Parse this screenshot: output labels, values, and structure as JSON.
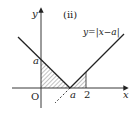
{
  "diagram": {
    "panel_label": "(ii)",
    "function_label": "y=|x−a|",
    "axes": {
      "x_label": "x",
      "y_label": "y",
      "origin_label": "O"
    },
    "ticks": {
      "y_a": "a",
      "x_a": "a",
      "x_2": "2"
    },
    "colors": {
      "line": "#222222",
      "hatch": "#555555",
      "background": "#ffffff"
    }
  }
}
